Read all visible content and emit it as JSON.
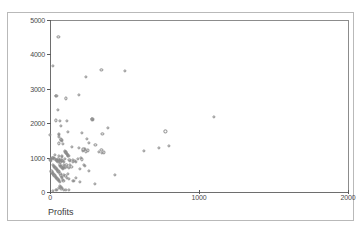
{
  "figure": {
    "background_color": "#ffffff",
    "frame_color": "#b9b9b9",
    "marker_color": "#8a8a8a",
    "axis_color": "#6e6e6e"
  },
  "chart_data": {
    "type": "scatter",
    "title": "",
    "xlabel": "Profits",
    "ylabel": "Total yearly compensation",
    "xlim": [
      0,
      2000
    ],
    "ylim": [
      0,
      5000
    ],
    "xticks": [
      0,
      1000,
      2000
    ],
    "yticks": [
      0,
      1000,
      2000,
      3000,
      4000,
      5000
    ],
    "xticklabels": [
      "0",
      "1000",
      "2000"
    ],
    "yticklabels": [
      "0",
      "1000",
      "2000",
      "3000",
      "4000",
      "5000"
    ],
    "grid": false,
    "legend": false,
    "marker": "open-circle",
    "series": [
      {
        "name": "companies",
        "points": [
          [
            56,
            4520
          ],
          [
            20,
            3670
          ],
          [
            243,
            3340
          ],
          [
            345,
            3560
          ],
          [
            500,
            3530
          ],
          [
            42,
            2800
          ],
          [
            43,
            2790
          ],
          [
            108,
            2720
          ],
          [
            195,
            2820
          ],
          [
            55,
            2380
          ],
          [
            38,
            2080
          ],
          [
            66,
            2060
          ],
          [
            113,
            2060
          ],
          [
            282,
            2110
          ],
          [
            285,
            2120
          ],
          [
            288,
            2100
          ],
          [
            73,
            1930
          ],
          [
            1100,
            2190
          ],
          [
            2,
            1660
          ],
          [
            60,
            1690
          ],
          [
            62,
            1650
          ],
          [
            60,
            1600
          ],
          [
            75,
            1530
          ],
          [
            77,
            1510
          ],
          [
            80,
            1480
          ],
          [
            120,
            1750
          ],
          [
            212,
            1710
          ],
          [
            352,
            1690
          ],
          [
            390,
            1860
          ],
          [
            775,
            1760
          ],
          [
            60,
            1410
          ],
          [
            88,
            1400
          ],
          [
            148,
            1300
          ],
          [
            224,
            1240
          ],
          [
            232,
            1250
          ],
          [
            240,
            1180
          ],
          [
            255,
            1210
          ],
          [
            222,
            1190
          ],
          [
            248,
            1540
          ],
          [
            262,
            1430
          ],
          [
            305,
            1380
          ],
          [
            330,
            1160
          ],
          [
            350,
            1140
          ],
          [
            345,
            1220
          ],
          [
            360,
            1150
          ],
          [
            628,
            1200
          ],
          [
            730,
            1290
          ],
          [
            800,
            1330
          ],
          [
            100,
            1200
          ],
          [
            104,
            1170
          ],
          [
            106,
            1150
          ],
          [
            108,
            1130
          ],
          [
            112,
            1110
          ],
          [
            116,
            1100
          ],
          [
            118,
            1090
          ],
          [
            120,
            1060
          ],
          [
            124,
            1040
          ],
          [
            80,
            1060
          ],
          [
            82,
            1030
          ],
          [
            60,
            1060
          ],
          [
            34,
            1070
          ],
          [
            16,
            1000
          ],
          [
            18,
            980
          ],
          [
            8,
            960
          ],
          [
            4,
            950
          ],
          [
            2,
            930
          ],
          [
            6,
            900
          ],
          [
            26,
            980
          ],
          [
            30,
            960
          ],
          [
            40,
            940
          ],
          [
            44,
            920
          ],
          [
            48,
            900
          ],
          [
            52,
            880
          ],
          [
            56,
            960
          ],
          [
            62,
            930
          ],
          [
            66,
            900
          ],
          [
            70,
            880
          ],
          [
            74,
            940
          ],
          [
            78,
            920
          ],
          [
            88,
            900
          ],
          [
            94,
            880
          ],
          [
            100,
            960
          ],
          [
            130,
            930
          ],
          [
            136,
            900
          ],
          [
            152,
            880
          ],
          [
            156,
            940
          ],
          [
            166,
            910
          ],
          [
            176,
            880
          ],
          [
            186,
            960
          ],
          [
            196,
            1290
          ],
          [
            205,
            980
          ],
          [
            212,
            950
          ],
          [
            230,
            780
          ],
          [
            236,
            760
          ],
          [
            200,
            680
          ],
          [
            260,
            620
          ],
          [
            20,
            790
          ],
          [
            24,
            760
          ],
          [
            28,
            740
          ],
          [
            32,
            720
          ],
          [
            36,
            700
          ],
          [
            40,
            680
          ],
          [
            44,
            660
          ],
          [
            48,
            640
          ],
          [
            52,
            620
          ],
          [
            56,
            600
          ],
          [
            60,
            580
          ],
          [
            64,
            800
          ],
          [
            68,
            770
          ],
          [
            72,
            750
          ],
          [
            76,
            730
          ],
          [
            80,
            710
          ],
          [
            84,
            690
          ],
          [
            88,
            670
          ],
          [
            92,
            780
          ],
          [
            96,
            740
          ],
          [
            100,
            700
          ],
          [
            110,
            780
          ],
          [
            116,
            740
          ],
          [
            126,
            700
          ],
          [
            134,
            780
          ],
          [
            144,
            740
          ],
          [
            10,
            600
          ],
          [
            14,
            570
          ],
          [
            18,
            540
          ],
          [
            22,
            520
          ],
          [
            26,
            500
          ],
          [
            30,
            480
          ],
          [
            34,
            460
          ],
          [
            38,
            440
          ],
          [
            42,
            420
          ],
          [
            46,
            400
          ],
          [
            50,
            380
          ],
          [
            54,
            360
          ],
          [
            58,
            340
          ],
          [
            62,
            320
          ],
          [
            66,
            300
          ],
          [
            70,
            520
          ],
          [
            74,
            480
          ],
          [
            78,
            440
          ],
          [
            82,
            400
          ],
          [
            86,
            360
          ],
          [
            90,
            320
          ],
          [
            96,
            500
          ],
          [
            104,
            460
          ],
          [
            112,
            420
          ],
          [
            120,
            520
          ],
          [
            128,
            380
          ],
          [
            152,
            330
          ],
          [
            158,
            320
          ],
          [
            175,
            400
          ],
          [
            198,
            290
          ],
          [
            300,
            230
          ],
          [
            436,
            490
          ],
          [
            68,
            180
          ],
          [
            72,
            150
          ],
          [
            58,
            120
          ],
          [
            78,
            110
          ],
          [
            76,
            80
          ],
          [
            94,
            70
          ],
          [
            106,
            60
          ],
          [
            38,
            60
          ],
          [
            44,
            50
          ],
          [
            126,
            50
          ],
          [
            20,
            40
          ]
        ]
      }
    ]
  }
}
